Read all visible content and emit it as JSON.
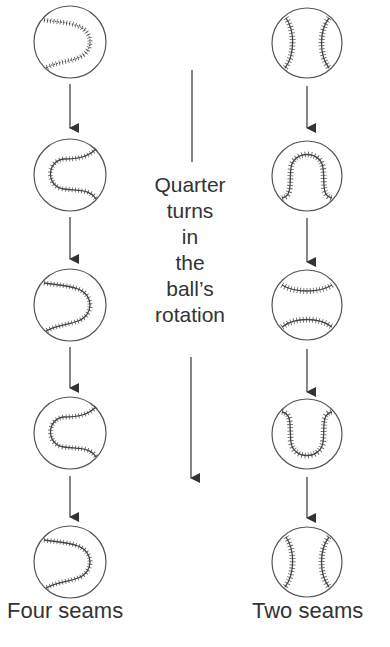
{
  "diagram": {
    "center_label_lines": [
      "Quarter",
      "turns",
      "in",
      "the",
      "ball’s",
      "rotation"
    ],
    "left_column": {
      "label": "Four seams",
      "balls": [
        {
          "seam": "four-seam-a"
        },
        {
          "seam": "four-seam-b"
        },
        {
          "seam": "four-seam-a"
        },
        {
          "seam": "four-seam-b"
        },
        {
          "seam": "four-seam-a"
        }
      ]
    },
    "right_column": {
      "label": "Two seams",
      "balls": [
        {
          "seam": "two-seam-vertical"
        },
        {
          "seam": "two-seam-arch"
        },
        {
          "seam": "two-seam-horizontal"
        },
        {
          "seam": "two-seam-cup"
        },
        {
          "seam": "two-seam-vertical"
        }
      ]
    },
    "colors": {
      "stroke": "#3a3a3a",
      "background": "#ffffff"
    }
  }
}
